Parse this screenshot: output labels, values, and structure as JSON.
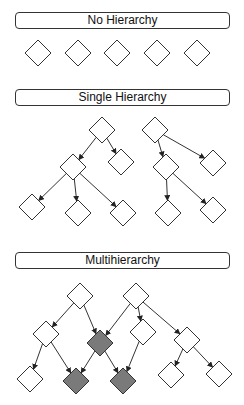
{
  "sections": [
    {
      "title": "No Hierarchy",
      "box_top": 12
    },
    {
      "title": "Single Hierarchy",
      "box_top": 89
    },
    {
      "title": "Multihierarchy",
      "box_top": 252
    }
  ],
  "colors": {
    "node_fill": "#ffffff",
    "shared_node_fill": "#7a7a7a",
    "stroke": "#333333"
  },
  "diagram": {
    "node_half_size": 13,
    "no_hierarchy_nodes": [
      [
        38,
        53
      ],
      [
        78,
        53
      ],
      [
        117,
        53
      ],
      [
        157,
        53
      ],
      [
        197,
        53
      ]
    ],
    "single_hierarchy": {
      "nodes": [
        [
          102,
          130
        ],
        [
          73,
          167
        ],
        [
          121,
          162
        ],
        [
          32,
          207
        ],
        [
          78,
          213
        ],
        [
          123,
          213
        ],
        [
          155,
          130
        ],
        [
          166,
          167
        ],
        [
          213,
          163
        ],
        [
          168,
          213
        ],
        [
          213,
          210
        ]
      ],
      "edges": [
        [
          0,
          1
        ],
        [
          0,
          2
        ],
        [
          1,
          3
        ],
        [
          1,
          4
        ],
        [
          1,
          5
        ],
        [
          6,
          7
        ],
        [
          6,
          8
        ],
        [
          7,
          9
        ],
        [
          7,
          10
        ]
      ]
    },
    "multihierarchy": {
      "nodes": [
        [
          80,
          296
        ],
        [
          46,
          334
        ],
        [
          100,
          343
        ],
        [
          30,
          379
        ],
        [
          76,
          381
        ],
        [
          123,
          381
        ],
        [
          136,
          296
        ],
        [
          143,
          332
        ],
        [
          187,
          340
        ],
        [
          171,
          375
        ],
        [
          219,
          374
        ]
      ],
      "shared": [
        2,
        4,
        5
      ],
      "edges": [
        [
          0,
          1
        ],
        [
          0,
          2
        ],
        [
          1,
          3
        ],
        [
          1,
          4
        ],
        [
          2,
          4
        ],
        [
          2,
          5
        ],
        [
          6,
          2
        ],
        [
          6,
          7
        ],
        [
          6,
          8
        ],
        [
          7,
          5
        ],
        [
          8,
          9
        ],
        [
          8,
          10
        ]
      ]
    }
  }
}
